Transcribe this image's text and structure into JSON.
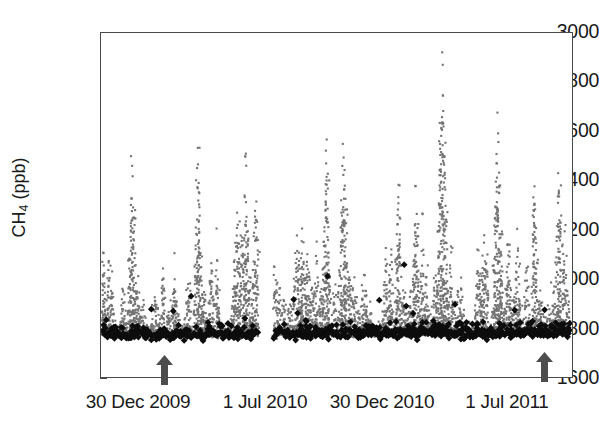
{
  "chart_data": {
    "type": "scatter",
    "title": "",
    "xlabel": "",
    "ylabel": "CH4 (ppb)",
    "ylabel_base": "CH",
    "ylabel_sub": "4",
    "ylabel_unit": " (ppb)",
    "ylim": [
      1600,
      3000
    ],
    "yticks": [
      3000,
      2800,
      2600,
      2400,
      2200,
      2000,
      1800,
      1600
    ],
    "ytick_labels": [
      "3000",
      "2800",
      "2600",
      "2400",
      "2200",
      "2000",
      "1800",
      "1600"
    ],
    "grid": false,
    "legend": "none",
    "xticks": [
      138,
      265,
      382,
      507
    ],
    "xtick_labels": [
      "30 Dec 2009",
      "1 Jul 2010",
      "30 Dec 2010",
      "1 Jul 2011"
    ],
    "xlim_label_start": "30 Dec 2009",
    "xlim_label_end": "1 Jul 2011",
    "data_gap": {
      "present": true,
      "start_px": 258,
      "end_px": 273
    },
    "series": [
      {
        "name": "individual measurements",
        "marker": "small-dot",
        "color": "#737373",
        "size_px": 2,
        "count_approx": 4200,
        "value_range": [
          1740,
          2970
        ],
        "description": "dense gray cloud of high-frequency CH4 observations, right-skewed above a 1780 ppb baseline"
      },
      {
        "name": "daily minima / baseline",
        "marker": "diamond",
        "color": "#0d0d0d",
        "size_px": 7,
        "count_approx": 620,
        "value_range": [
          1745,
          2090
        ],
        "description": "black diamonds tracing the lower envelope near 1780 ppb with occasional excursions to 2090 ppb"
      }
    ],
    "annotations": [
      {
        "type": "arrow",
        "direction": "up",
        "x_px": 164,
        "y_px": 355,
        "color": "#4d4d4d"
      },
      {
        "type": "arrow",
        "direction": "up",
        "x_px": 544,
        "y_px": 352,
        "color": "#4d4d4d"
      }
    ],
    "colors": {
      "dot": "#737373",
      "diamond": "#0d0d0d",
      "axis": "#4a4a4a",
      "text": "#1a1a1a",
      "arrow": "#4d4d4d",
      "background": "#ffffff"
    }
  }
}
